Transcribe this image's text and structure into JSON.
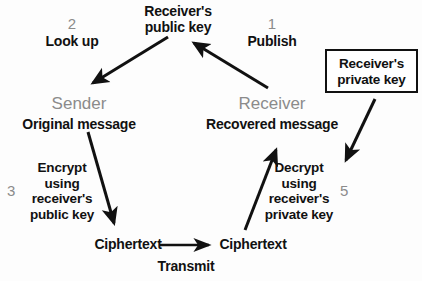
{
  "diagram": {
    "background_color": "#fdfdfd",
    "text_color": "#111111",
    "muted_color": "#8b8b8b",
    "arrow_color": "#111111"
  },
  "labels": {
    "step1_number": "1",
    "step1_action": "Publish",
    "step2_number": "2",
    "step2_action": "Look up",
    "step3_number": "3",
    "step3_action": "Encrypt\nusing\nreceiver's\npublic key",
    "step5_number": "5",
    "step5_action": "Decrypt\nusing\nreceiver's\nprivate key",
    "public_key": "Receiver's\npublic key",
    "private_key": "Receiver's\nprivate key",
    "sender_role": "Sender",
    "receiver_role": "Receiver",
    "original_message": "Original message",
    "recovered_message": "Recovered message",
    "ciphertext_left": "Ciphertext",
    "ciphertext_right": "Ciphertext",
    "transmit": "Transmit"
  },
  "arrows": [
    {
      "name": "lookup-arrow",
      "from": [
        168,
        37
      ],
      "to": [
        89,
        86
      ]
    },
    {
      "name": "publish-arrow",
      "from": [
        268,
        88
      ],
      "to": [
        190,
        39
      ]
    },
    {
      "name": "encrypt-arrow",
      "from": [
        88,
        132
      ],
      "to": [
        116,
        229
      ]
    },
    {
      "name": "decrypt-arrow",
      "from": [
        245,
        230
      ],
      "to": [
        278,
        144
      ]
    },
    {
      "name": "private-key-arrow",
      "from": [
        375,
        99
      ],
      "to": [
        343,
        166
      ]
    },
    {
      "name": "transmit-arrow",
      "from": [
        160,
        245
      ],
      "to": [
        216,
        245
      ]
    }
  ]
}
